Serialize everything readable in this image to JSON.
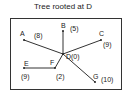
{
  "title": "Tree rooted at D",
  "colors": {
    "line": "#333333",
    "frame": "#333333",
    "text": "#222222",
    "background": "#ffffff"
  },
  "nodes": [
    {
      "id": "A",
      "label": "A",
      "value": "(8)"
    },
    {
      "id": "B",
      "label": "B",
      "value": "(5)"
    },
    {
      "id": "C",
      "label": "C",
      "value": "(9)"
    },
    {
      "id": "D",
      "label": "D",
      "value": "(0)"
    },
    {
      "id": "E",
      "label": "E",
      "value": "(9)"
    },
    {
      "id": "F",
      "label": "F",
      "value": "(2)"
    },
    {
      "id": "G",
      "label": "G",
      "value": "(10)"
    }
  ],
  "edges": [
    [
      "D",
      "A"
    ],
    [
      "D",
      "B"
    ],
    [
      "D",
      "C"
    ],
    [
      "D",
      "F"
    ],
    [
      "F",
      "E"
    ],
    [
      "D",
      "G"
    ]
  ]
}
